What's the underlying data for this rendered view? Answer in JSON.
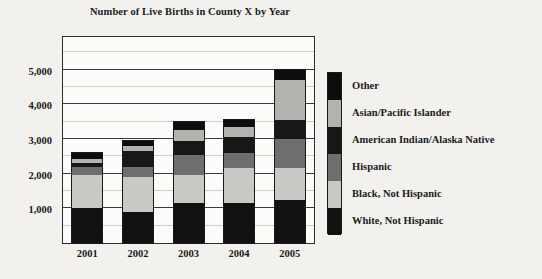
{
  "chart_data": {
    "type": "bar",
    "subtype": "stacked-vertical",
    "title": "Number of Live Births in County X by Year",
    "xlabel": "",
    "ylabel": "",
    "categories": [
      "2001",
      "2002",
      "2003",
      "2004",
      "2005"
    ],
    "ylim": [
      0,
      6000
    ],
    "y_ticks": [
      1000,
      2000,
      3000,
      4000,
      5000
    ],
    "y_tick_labels": [
      "1,000",
      "2,000",
      "3,000",
      "4,000",
      "5,000"
    ],
    "y_minor_step": 500,
    "grid": true,
    "legend_position": "right",
    "series": [
      {
        "name": "White, Not Hispanic",
        "color": "#111111",
        "values": [
          1000,
          900,
          1150,
          1150,
          1250
        ]
      },
      {
        "name": "Black, Not Hispanic",
        "color": "#c8c8c4",
        "values": [
          950,
          1000,
          800,
          1000,
          900
        ]
      },
      {
        "name": "Hispanic",
        "color": "#6e6e6e",
        "values": [
          230,
          300,
          600,
          450,
          850
        ]
      },
      {
        "name": "American Indian/Alaska Native",
        "color": "#171717",
        "values": [
          130,
          450,
          400,
          450,
          550
        ]
      },
      {
        "name": "Asian/Pacific Islander",
        "color": "#b2b2ae",
        "values": [
          120,
          150,
          300,
          300,
          1150
        ]
      },
      {
        "name": "Other",
        "color": "#0d0d0d",
        "values": [
          170,
          150,
          250,
          200,
          300
        ]
      }
    ],
    "totals": [
      2600,
      2950,
      3500,
      3550,
      5000
    ]
  },
  "legend": {
    "entries": [
      {
        "label": "Other",
        "color": "#0d0d0d"
      },
      {
        "label": "Asian/Pacific Islander",
        "color": "#b2b2ae"
      },
      {
        "label": "American Indian/Alaska Native",
        "color": "#171717"
      },
      {
        "label": "Hispanic",
        "color": "#6e6e6e"
      },
      {
        "label": "Black, Not Hispanic",
        "color": "#c8c8c4"
      },
      {
        "label": "White, Not Hispanic",
        "color": "#111111"
      }
    ]
  },
  "colors": {
    "background": "#f2f1ee",
    "plot_background": "#fbfbf9",
    "axis": "#2b2b2b",
    "gridline_minor": "#cfcfca",
    "gridline_major": "#3a3a3a",
    "text": "#1b1b1b"
  }
}
